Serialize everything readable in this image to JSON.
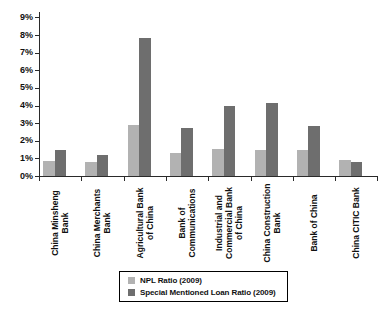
{
  "chart_data": {
    "type": "bar",
    "title": "",
    "categories": [
      "China Minsheng\nBank",
      "China Merchants\nBank",
      "Agricultural Bank\nof China",
      "Bank of\nCommunications",
      "Industrial and\nCommercial Bank\nof China",
      "China Construction\nBank",
      "Bank of China",
      "China CITIC Bank"
    ],
    "series": [
      {
        "key": "npl",
        "name": "NPL Ratio (2009)",
        "color": "#b2b2b2",
        "values": [
          0.84,
          0.8,
          2.91,
          1.32,
          1.54,
          1.5,
          1.5,
          0.9
        ]
      },
      {
        "key": "sml",
        "name": "Special Mentioned Loan Ratio (2009)",
        "color": "#6e6e6e",
        "values": [
          1.47,
          1.2,
          7.85,
          2.71,
          4.0,
          4.15,
          2.85,
          0.78
        ]
      }
    ],
    "xlabel": "",
    "ylabel": "",
    "y_axis": {
      "min": 0,
      "max": 9,
      "step": 1,
      "suffix": "%",
      "tick_labels": [
        "0%",
        "1%",
        "2%",
        "3%",
        "4%",
        "5%",
        "6%",
        "7%",
        "8%",
        "9%"
      ]
    },
    "grid": false,
    "legend_position": "bottom-center",
    "colors": {
      "axis": "#2a2a2a",
      "text": "#111111",
      "background": "#ffffff"
    }
  }
}
